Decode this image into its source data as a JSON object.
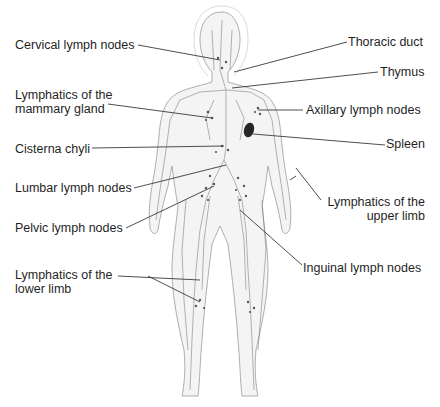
{
  "diagram": {
    "colors": {
      "text": "#1f1f1f",
      "leader_line": "#3a3a3a",
      "body_outline": "#9a9a9a",
      "body_fill": "#f4f4f4",
      "lymph_vessels": "#6e6e6e",
      "spleen": "#262626"
    },
    "labels_left": [
      {
        "id": "cervical",
        "text": "Cervical lymph nodes"
      },
      {
        "id": "mammary",
        "line1": "Lymphatics of the",
        "line2": "mammary gland"
      },
      {
        "id": "cisterna",
        "text": "Cisterna chyli"
      },
      {
        "id": "lumbar",
        "text": "Lumbar lymph nodes"
      },
      {
        "id": "pelvic",
        "text": "Pelvic lymph nodes"
      },
      {
        "id": "lower_limb",
        "line1": "Lymphatics of the",
        "line2": "lower limb"
      }
    ],
    "labels_right": [
      {
        "id": "thoracic",
        "text": "Thoracic duct"
      },
      {
        "id": "thymus",
        "text": "Thymus"
      },
      {
        "id": "axillary",
        "text": "Axillary lymph nodes"
      },
      {
        "id": "spleen",
        "text": "Spleen"
      },
      {
        "id": "upper_limb",
        "line1": "Lymphatics of the",
        "line2": "upper limb"
      },
      {
        "id": "inguinal",
        "text": "Inguinal lymph nodes"
      }
    ]
  }
}
